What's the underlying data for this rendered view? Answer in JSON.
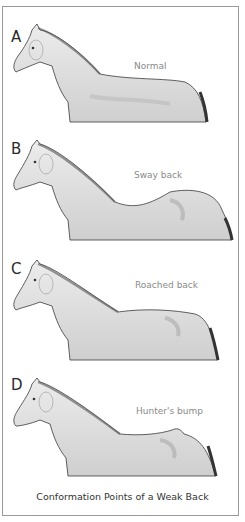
{
  "figure": {
    "caption": "Conformation Points of a Weak Back",
    "panels": [
      {
        "letter": "A",
        "label": "Normal",
        "back": "normal"
      },
      {
        "letter": "B",
        "label": "Sway back",
        "back": "sway"
      },
      {
        "letter": "C",
        "label": "Roached back",
        "back": "roached"
      },
      {
        "letter": "D",
        "label": "Hunter's bump",
        "back": "bump"
      }
    ]
  },
  "colors": {
    "border": "#9a9a9a",
    "label_text": "#8a8a8a",
    "letter_text": "#2a2a2a",
    "caption_text": "#333333",
    "outline": "#3a3a3a",
    "shading": "#bdbdbd"
  }
}
